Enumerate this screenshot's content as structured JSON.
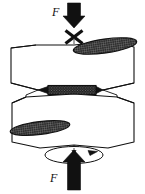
{
  "figure": {
    "background_color": "#ffffff",
    "line_color": "#111111",
    "hatch_fill_color": "#2b2b2b",
    "arrow_color": "#111111",
    "width": 145,
    "height": 194
  },
  "labels": {
    "force_top": "F",
    "force_bottom": "F"
  },
  "elements": {
    "top_force_arrow": "down-arrow-icon",
    "cross_mark": "x-mark-icon",
    "upper_workpiece": "upper-cylinder",
    "upper_end_face": "hatched-ellipse-top",
    "weld_zone": "hatched-weld-band",
    "lower_workpiece": "lower-cylinder",
    "lower_end_face": "hatched-ellipse-bottom",
    "center_axis": "dash-dot-centerline",
    "rotation_indicator": "rotation-ellipse-arrow",
    "bottom_force_arrow": "up-arrow-icon"
  }
}
